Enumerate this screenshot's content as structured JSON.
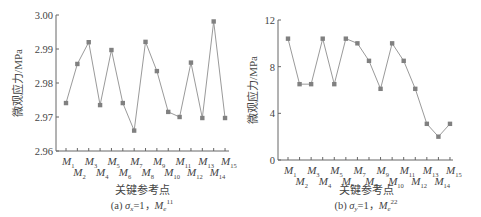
{
  "chart_data": [
    {
      "type": "line",
      "panel": "a",
      "title": "",
      "caption": "(a) σx=1, Me^11",
      "caption_prefix": "(a) ",
      "caption_sigma": "σ",
      "caption_sigma_sub": "x",
      "caption_mid": "=1，",
      "caption_m": "M",
      "caption_m_sub": "e",
      "caption_m_sup": "11",
      "xlabel": "关键参考点",
      "ylabel": "微观应力/MPa",
      "categories": [
        "M1",
        "M2",
        "M3",
        "M4",
        "M5",
        "M6",
        "M7",
        "M8",
        "M9",
        "M10",
        "M11",
        "M12",
        "M13",
        "M14",
        "M15"
      ],
      "category_subscripts": [
        "1",
        "2",
        "3",
        "4",
        "5",
        "6",
        "7",
        "8",
        "9",
        "10",
        "11",
        "12",
        "13",
        "14",
        "15"
      ],
      "values": [
        2.9741,
        2.9856,
        2.992,
        2.9735,
        2.9897,
        2.9741,
        2.966,
        2.9921,
        2.9835,
        2.9715,
        2.97,
        2.986,
        2.9697,
        2.9981,
        2.9697
      ],
      "ylim": [
        2.96,
        3.0
      ],
      "yticks": [
        2.96,
        2.97,
        2.98,
        2.99,
        3.0
      ],
      "ytick_labels": [
        "2.96",
        "2.97",
        "2.98",
        "2.99",
        "3.00"
      ],
      "grid": false,
      "legend": null,
      "marker": "square",
      "line_color": "#9a9a9a",
      "marker_color": "#808080"
    },
    {
      "type": "line",
      "panel": "b",
      "title": "",
      "caption": "(b) σy=1, Me^22",
      "caption_prefix": "(b) ",
      "caption_sigma": "σ",
      "caption_sigma_sub": "y",
      "caption_mid": "=1，",
      "caption_m": "M",
      "caption_m_sub": "e",
      "caption_m_sup": "22",
      "xlabel": "关键参考点",
      "ylabel": "微观应力/MPa",
      "categories": [
        "M1",
        "M2",
        "M3",
        "M4",
        "M5",
        "M6",
        "M7",
        "M8",
        "M9",
        "M10",
        "M11",
        "M12",
        "M13",
        "M14",
        "M15"
      ],
      "category_subscripts": [
        "1",
        "2",
        "3",
        "4",
        "5",
        "6",
        "7",
        "8",
        "9",
        "10",
        "11",
        "12",
        "13",
        "14",
        "15"
      ],
      "values": [
        10.4,
        6.5,
        6.5,
        10.4,
        6.5,
        10.4,
        10.0,
        8.5,
        6.1,
        10.0,
        8.5,
        6.1,
        3.1,
        2.0,
        3.1
      ],
      "ylim": [
        0,
        12
      ],
      "yticks": [
        0,
        4,
        8,
        12
      ],
      "ytick_labels": [
        "0",
        "4",
        "8",
        "12"
      ],
      "grid": false,
      "legend": null,
      "marker": "square",
      "line_color": "#9a9a9a",
      "marker_color": "#808080"
    }
  ]
}
